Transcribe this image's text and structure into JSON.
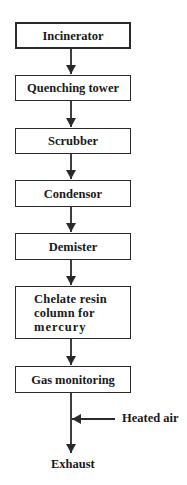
{
  "diagram": {
    "type": "process-flowchart",
    "steps": [
      {
        "label": "Incinerator"
      },
      {
        "label": "Quenching tower"
      },
      {
        "label": "Scrubber"
      },
      {
        "label": "Condensor"
      },
      {
        "label": "Demister"
      },
      {
        "label_lines": [
          "Chelate resin",
          "column for",
          "mercury"
        ]
      },
      {
        "label": "Gas monitoring"
      }
    ],
    "side_input": {
      "label": "Heated air"
    },
    "output": {
      "label": "Exhaust"
    },
    "colors": {
      "line": "#2a2a2a",
      "text": "#1a1a1a",
      "background": "#ffffff"
    }
  }
}
